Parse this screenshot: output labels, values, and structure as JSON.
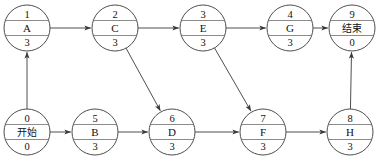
{
  "diagram": {
    "kind": "aoe-activity-network",
    "canvas": {
      "width": 381,
      "height": 162
    },
    "node_radius": 23,
    "nodes": [
      {
        "id": "A",
        "label": "A",
        "top": "1",
        "bottom": "3",
        "cx": 27,
        "cy": 28,
        "cjk": false
      },
      {
        "id": "C",
        "label": "C",
        "top": "2",
        "bottom": "3",
        "cx": 115,
        "cy": 28,
        "cjk": false
      },
      {
        "id": "E",
        "label": "E",
        "top": "3",
        "bottom": "3",
        "cx": 203,
        "cy": 28,
        "cjk": false
      },
      {
        "id": "G",
        "label": "G",
        "top": "4",
        "bottom": "3",
        "cx": 290,
        "cy": 28,
        "cjk": false
      },
      {
        "id": "END",
        "label": "结束",
        "top": "9",
        "bottom": "0",
        "cx": 352,
        "cy": 28,
        "cjk": true
      },
      {
        "id": "START",
        "label": "开始",
        "top": "0",
        "bottom": "0",
        "cx": 27,
        "cy": 132,
        "cjk": true
      },
      {
        "id": "B",
        "label": "B",
        "top": "5",
        "bottom": "3",
        "cx": 95,
        "cy": 132,
        "cjk": false
      },
      {
        "id": "D",
        "label": "D",
        "top": "6",
        "bottom": "3",
        "cx": 172,
        "cy": 132,
        "cjk": false
      },
      {
        "id": "F",
        "label": "F",
        "top": "7",
        "bottom": "3",
        "cx": 263,
        "cy": 132,
        "cjk": false
      },
      {
        "id": "H",
        "label": "H",
        "top": "8",
        "bottom": "3",
        "cx": 350,
        "cy": 132,
        "cjk": false
      }
    ],
    "edges": [
      {
        "id": "start-to-a",
        "from": "START",
        "to": "A"
      },
      {
        "id": "a-to-c",
        "from": "A",
        "to": "C"
      },
      {
        "id": "c-to-e",
        "from": "C",
        "to": "E"
      },
      {
        "id": "e-to-g",
        "from": "E",
        "to": "G"
      },
      {
        "id": "g-to-end",
        "from": "G",
        "to": "END"
      },
      {
        "id": "start-to-b",
        "from": "START",
        "to": "B"
      },
      {
        "id": "b-to-d",
        "from": "B",
        "to": "D"
      },
      {
        "id": "c-to-d",
        "from": "C",
        "to": "D"
      },
      {
        "id": "d-to-f",
        "from": "D",
        "to": "F"
      },
      {
        "id": "e-to-f",
        "from": "E",
        "to": "F"
      },
      {
        "id": "f-to-h",
        "from": "F",
        "to": "H"
      },
      {
        "id": "h-to-end",
        "from": "H",
        "to": "END"
      }
    ]
  }
}
